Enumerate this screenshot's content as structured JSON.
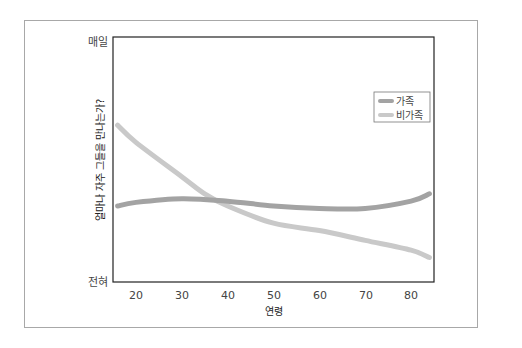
{
  "chart_data": {
    "type": "line",
    "title": "",
    "xlabel": "연령",
    "ylabel": "얼마나 자주 그들을 만나는가?",
    "x_ticks": [
      20,
      30,
      40,
      50,
      60,
      70,
      80
    ],
    "xlim": [
      15,
      85
    ],
    "y_ticks": [
      {
        "value": 0,
        "label": "전혀"
      },
      {
        "value": 100,
        "label": "매일"
      }
    ],
    "ylim": [
      0,
      100
    ],
    "grid": false,
    "legend_position": "upper right",
    "series": [
      {
        "name": "가족",
        "color": "#a3a3a3",
        "x": [
          16,
          20,
          30,
          40,
          50,
          60,
          70,
          80,
          84
        ],
        "values": [
          31,
          32.5,
          34,
          33,
          31,
          30,
          30,
          33,
          36
        ]
      },
      {
        "name": "비가족",
        "color": "#c9c9c9",
        "x": [
          16,
          20,
          30,
          35,
          40,
          50,
          60,
          70,
          80,
          84
        ],
        "values": [
          64,
          57,
          43,
          36,
          31,
          24,
          21,
          17,
          13,
          10
        ]
      }
    ]
  },
  "labels": {
    "y_top": "매일",
    "y_bottom": "전혀",
    "y_title": "얼마나 자주 그들을 만나는가?",
    "x_title": "연령",
    "legend_family": "가족",
    "legend_nonfamily": "비가족",
    "x_ticks": [
      "20",
      "30",
      "40",
      "50",
      "60",
      "70",
      "80"
    ]
  }
}
